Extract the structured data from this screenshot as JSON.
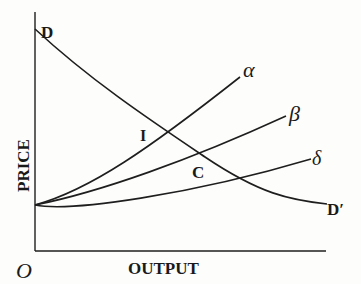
{
  "diagram": {
    "type": "supply-demand",
    "axes": {
      "y_label": "PRICE",
      "x_label": "OUTPUT",
      "origin_label": "O"
    },
    "curves": {
      "demand": {
        "start_label": "D",
        "end_label": "D′"
      },
      "supply_alpha": {
        "label": "α"
      },
      "supply_beta": {
        "label": "β"
      },
      "supply_delta": {
        "label": "δ"
      }
    },
    "points": {
      "I": {
        "label": "I"
      },
      "C": {
        "label": "C"
      }
    },
    "colors": {
      "ink": "#1e1e1e",
      "paper": "#fdfdfb"
    }
  }
}
